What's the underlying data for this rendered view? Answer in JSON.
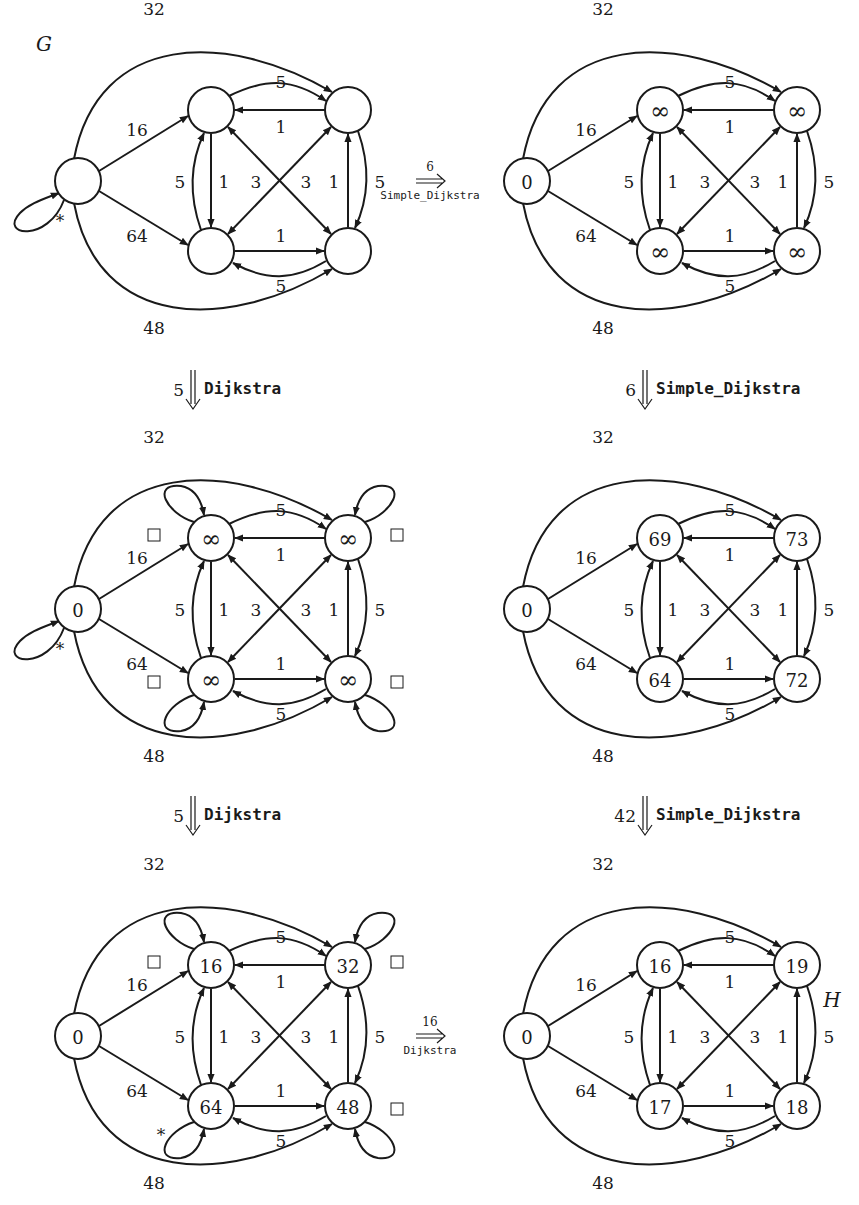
{
  "colors": {
    "ink": "#1a1a1a",
    "background": "#ffffff"
  },
  "graphs": [
    {
      "id": "g1",
      "label": "G",
      "label_pos": [
        44,
        44
      ],
      "origin": [
        0,
        0
      ],
      "nodes": {
        "s": "",
        "a": "",
        "b": "",
        "c": "",
        "d": ""
      },
      "loops": {
        "s": true
      },
      "marks": {
        "star": "s",
        "boxes": []
      }
    },
    {
      "id": "g2",
      "label": "",
      "origin": [
        449,
        0
      ],
      "nodes": {
        "s": "0",
        "a": "∞",
        "b": "∞",
        "c": "∞",
        "d": "∞"
      },
      "loops": {},
      "marks": {
        "star": null,
        "boxes": []
      }
    },
    {
      "id": "g3",
      "label": "",
      "origin": [
        0,
        428
      ],
      "nodes": {
        "s": "0",
        "a": "∞",
        "b": "∞",
        "c": "∞",
        "d": "∞"
      },
      "loops": {
        "s": true,
        "a": true,
        "b": true,
        "c": true,
        "d": true
      },
      "marks": {
        "star": "s",
        "boxes": [
          "a",
          "b",
          "c",
          "d"
        ]
      }
    },
    {
      "id": "g4",
      "label": "",
      "origin": [
        449,
        428
      ],
      "nodes": {
        "s": "0",
        "a": "69",
        "b": "73",
        "c": "64",
        "d": "72"
      },
      "loops": {},
      "marks": {
        "star": null,
        "boxes": []
      }
    },
    {
      "id": "g5",
      "label": "",
      "origin": [
        0,
        855
      ],
      "nodes": {
        "s": "0",
        "a": "16",
        "b": "32",
        "c": "64",
        "d": "48"
      },
      "loops": {
        "a": true,
        "b": true,
        "c": true,
        "d": true
      },
      "marks": {
        "star": "c",
        "boxes": [
          "a",
          "b",
          "d"
        ]
      }
    },
    {
      "id": "g6",
      "label": "H",
      "label_pos": [
        832,
        1000
      ],
      "origin": [
        449,
        855
      ],
      "nodes": {
        "s": "0",
        "a": "16",
        "b": "19",
        "c": "17",
        "d": "18"
      },
      "loops": {},
      "marks": {
        "star": null,
        "boxes": []
      }
    }
  ],
  "edge_weights": {
    "s_b_outer": "32",
    "s_a": "16",
    "s_c": "64",
    "s_d_outer": "48",
    "a_b": "5",
    "b_a": "1",
    "c_d": "1",
    "d_c": "5",
    "c_a": "5",
    "a_c": "1",
    "d_b": "1",
    "b_d": "5",
    "a_d_cross": "3",
    "c_b_cross": "3"
  },
  "transitions": [
    {
      "id": "t1",
      "dir": "right",
      "count": "6",
      "algorithm": "Simple_Dijkstra",
      "pos": [
        430,
        181
      ]
    },
    {
      "id": "t2",
      "dir": "down",
      "count": "5",
      "algorithm": "Dijkstra",
      "pos": [
        193,
        390
      ]
    },
    {
      "id": "t3",
      "dir": "down",
      "count": "6",
      "algorithm": "Simple_Dijkstra",
      "pos": [
        645,
        390
      ]
    },
    {
      "id": "t4",
      "dir": "down",
      "count": "5",
      "algorithm": "Dijkstra",
      "pos": [
        193,
        816
      ]
    },
    {
      "id": "t5",
      "dir": "down",
      "count": "42",
      "algorithm": "Simple_Dijkstra",
      "pos": [
        645,
        816
      ]
    },
    {
      "id": "t6",
      "dir": "right",
      "count": "16",
      "algorithm": "Dijkstra",
      "pos": [
        430,
        1036
      ]
    }
  ]
}
